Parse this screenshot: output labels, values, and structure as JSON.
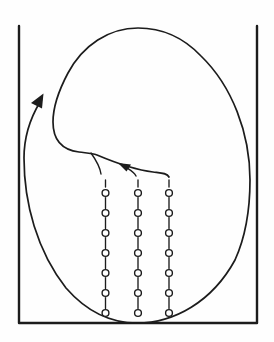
{
  "canvas": {
    "width": 274,
    "height": 342,
    "background": "#fefefe",
    "ink": "#1c1c1c"
  },
  "container": {
    "kind": "open-top-vessel",
    "left_x": 19,
    "right_x": 257,
    "top_y": 26,
    "bottom_y": 323,
    "wall_stroke_width": 2.4
  },
  "circulation": {
    "kind": "spiral-streamline",
    "direction": "clockwise",
    "stroke_width": 1.7,
    "main_arrow": {
      "tip_x": 43,
      "tip_y": 94,
      "orientation": "up-right-along-left-side"
    },
    "inner_arrow": {
      "tip_x": 118,
      "tip_y": 163,
      "orientation": "up-left-along-convergence-curve"
    },
    "extents": {
      "top_y": 28,
      "right_x": 250,
      "bottom_y": 323,
      "left_x": 24
    }
  },
  "chains": {
    "count": 3,
    "x_positions": [
      105.5,
      138,
      169
    ],
    "top_dash_y1": 180,
    "top_dash_y2": 187,
    "beads_per_chain": 7,
    "first_bead_y": 193,
    "bead_spacing": 20,
    "bead_radius": 3.4,
    "link_gap": 4.6,
    "stroke_width": 1.35,
    "bead_fill": "#fefefe"
  }
}
